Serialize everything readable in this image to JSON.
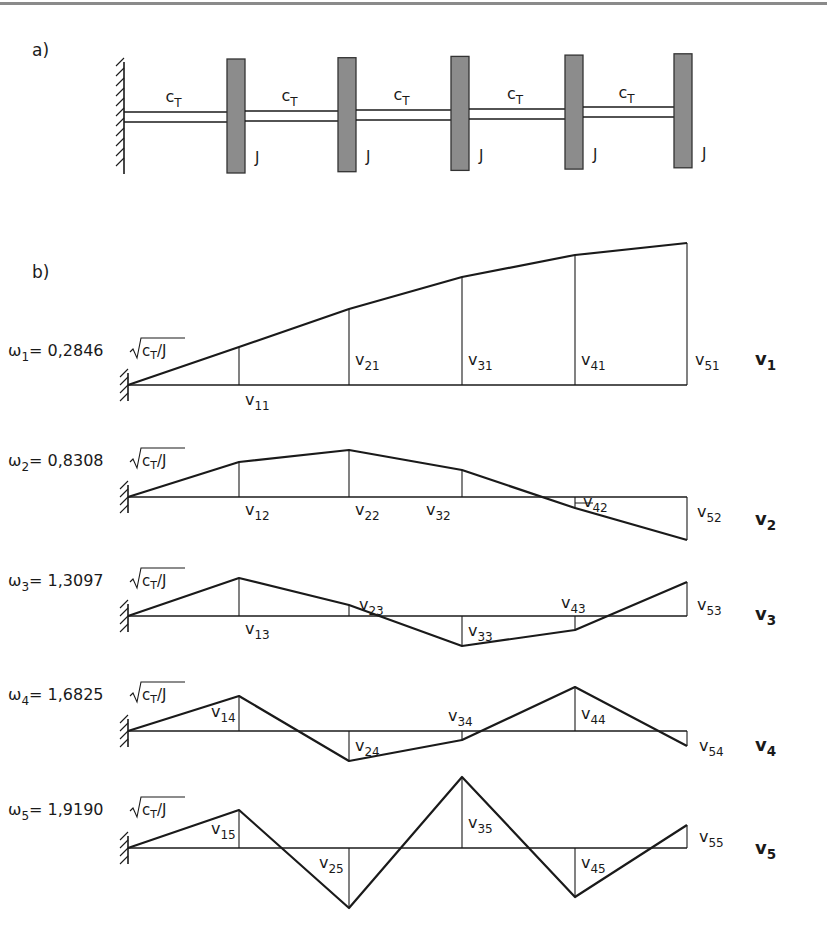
{
  "part_a": {
    "label": "a)",
    "spring_label": "c",
    "spring_sub": "T",
    "inertia_label": "J",
    "disks": 5,
    "segments": 5
  },
  "part_b": {
    "label": "b)",
    "modes": [
      {
        "omega_sym": "ω",
        "index": "1",
        "coef": "0,2846",
        "root": "c",
        "root_sub": "T",
        "root_den": "/J",
        "vector": "v",
        "vector_sub": "1",
        "labels": [
          "v11",
          "v21",
          "v31",
          "v41",
          "v51"
        ],
        "amplitudes": [
          38,
          76,
          108,
          130,
          142
        ]
      },
      {
        "omega_sym": "ω",
        "index": "2",
        "coef": "0,8308",
        "root": "c",
        "root_sub": "T",
        "root_den": "/J",
        "vector": "v",
        "vector_sub": "2",
        "labels": [
          "v12",
          "v22",
          "v32",
          "v42",
          "v52"
        ],
        "amplitudes": [
          35,
          47,
          27,
          -11,
          -43
        ]
      },
      {
        "omega_sym": "ω",
        "index": "3",
        "coef": "1,3097",
        "root": "c",
        "root_sub": "T",
        "root_den": "/J",
        "vector": "v",
        "vector_sub": "3",
        "labels": [
          "v13",
          "v23",
          "v33",
          "v43",
          "v53"
        ],
        "amplitudes": [
          38,
          11,
          -30,
          -14,
          34
        ]
      },
      {
        "omega_sym": "ω",
        "index": "4",
        "coef": "1,6825",
        "root": "c",
        "root_sub": "T",
        "root_den": "/J",
        "vector": "v",
        "vector_sub": "4",
        "labels": [
          "v14",
          "v24",
          "v34",
          "v44",
          "v54"
        ],
        "amplitudes": [
          35,
          -30,
          -9,
          44,
          -15
        ]
      },
      {
        "omega_sym": "ω",
        "index": "5",
        "coef": "1,9190",
        "root": "c",
        "root_sub": "T",
        "root_den": "/J",
        "vector": "v",
        "vector_sub": "5",
        "labels": [
          "v15",
          "v25",
          "v35",
          "v45",
          "v55"
        ],
        "amplitudes": [
          38,
          -60,
          71,
          -49,
          23
        ]
      }
    ]
  },
  "colors": {
    "ink": "#1a1a1a",
    "disk_fill": "#8c8c8c",
    "rule": "#8a8a8a"
  }
}
